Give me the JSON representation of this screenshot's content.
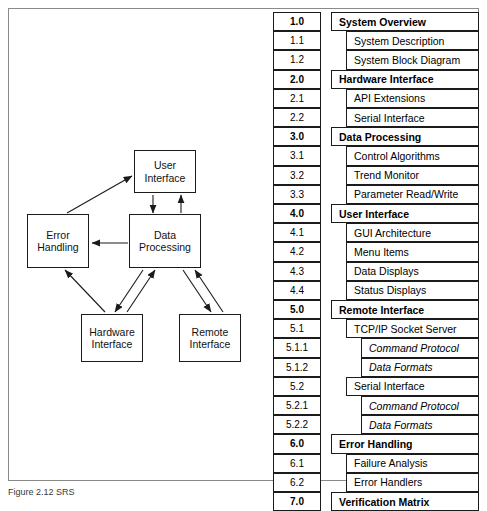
{
  "figure": {
    "caption": "Figure 2.12 SRS"
  },
  "block_diagram": {
    "name": "software-architecture-block-diagram",
    "nodes": [
      {
        "id": "user-interface",
        "lines": [
          "User",
          "Interface"
        ],
        "x": 125,
        "y": 141,
        "w": 62,
        "h": 43
      },
      {
        "id": "error-handling",
        "lines": [
          "Error",
          "Handling"
        ],
        "x": 18,
        "y": 205,
        "w": 62,
        "h": 54
      },
      {
        "id": "data-processing",
        "lines": [
          "Data",
          "Processing"
        ],
        "x": 120,
        "y": 205,
        "w": 72,
        "h": 54
      },
      {
        "id": "hardware-interface",
        "lines": [
          "Hardware",
          "Interface"
        ],
        "x": 72,
        "y": 305,
        "w": 62,
        "h": 48
      },
      {
        "id": "remote-interface",
        "lines": [
          "Remote",
          "Interface"
        ],
        "x": 170,
        "y": 305,
        "w": 62,
        "h": 48
      }
    ],
    "connections": [
      {
        "from": "data-processing",
        "to": "user-interface",
        "direction": "bidirectional"
      },
      {
        "from": "data-processing",
        "to": "error-handling",
        "direction": "unidirectional"
      },
      {
        "from": "hardware-interface",
        "to": "error-handling",
        "direction": "unidirectional"
      },
      {
        "from": "hardware-interface",
        "to": "user-interface",
        "direction": "unidirectional"
      },
      {
        "from": "data-processing",
        "to": "hardware-interface",
        "direction": "bidirectional"
      },
      {
        "from": "data-processing",
        "to": "remote-interface",
        "direction": "bidirectional"
      }
    ]
  },
  "outline": {
    "name": "srs-requirements-outline",
    "rows": [
      {
        "number": "1.0",
        "title": "System Overview",
        "level": 1
      },
      {
        "number": "1.1",
        "title": "System Description",
        "level": 2
      },
      {
        "number": "1.2",
        "title": "System Block Diagram",
        "level": 2
      },
      {
        "number": "2.0",
        "title": "Hardware Interface",
        "level": 1
      },
      {
        "number": "2.1",
        "title": "API Extensions",
        "level": 2
      },
      {
        "number": "2.2",
        "title": "Serial Interface",
        "level": 2
      },
      {
        "number": "3.0",
        "title": "Data Processing",
        "level": 1
      },
      {
        "number": "3.1",
        "title": "Control Algorithms",
        "level": 2
      },
      {
        "number": "3.2",
        "title": "Trend Monitor",
        "level": 2
      },
      {
        "number": "3.3",
        "title": "Parameter Read/Write",
        "level": 2
      },
      {
        "number": "4.0",
        "title": "User Interface",
        "level": 1
      },
      {
        "number": "4.1",
        "title": "GUI Architecture",
        "level": 2
      },
      {
        "number": "4.2",
        "title": "Menu Items",
        "level": 2
      },
      {
        "number": "4.3",
        "title": "Data Displays",
        "level": 2
      },
      {
        "number": "4.4",
        "title": "Status Displays",
        "level": 2
      },
      {
        "number": "5.0",
        "title": "Remote Interface",
        "level": 1
      },
      {
        "number": "5.1",
        "title": "TCP/IP Socket Server",
        "level": 2
      },
      {
        "number": "5.1.1",
        "title": "Command Protocol",
        "level": 3
      },
      {
        "number": "5.1.2",
        "title": "Data Formats",
        "level": 3
      },
      {
        "number": "5.2",
        "title": "Serial Interface",
        "level": 2
      },
      {
        "number": "5.2.1",
        "title": "Command Protocol",
        "level": 3
      },
      {
        "number": "5.2.2",
        "title": "Data Formats",
        "level": 3
      },
      {
        "number": "6.0",
        "title": "Error Handling",
        "level": 1
      },
      {
        "number": "6.1",
        "title": "Failure Analysis",
        "level": 2
      },
      {
        "number": "6.2",
        "title": "Error Handlers",
        "level": 2
      },
      {
        "number": "7.0",
        "title": "Verification Matrix",
        "level": 1
      }
    ]
  },
  "colors": {
    "line": "#1b1b1b",
    "frame": "#8a8a8a",
    "background": "#ffffff"
  }
}
